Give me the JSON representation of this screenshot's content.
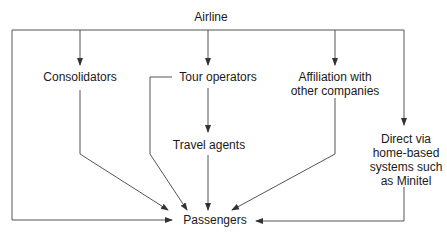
{
  "diagram": {
    "nodes": {
      "airline": {
        "label": "Airline"
      },
      "consolidators": {
        "label": "Consolidators"
      },
      "tour_operators": {
        "label": "Tour operators"
      },
      "affiliation": {
        "line1": "Affiliation with",
        "line2": "other companies"
      },
      "travel_agents": {
        "label": "Travel agents"
      },
      "direct": {
        "line1": "Direct via",
        "line2": "home-based",
        "line3": "systems such",
        "line4": "as Minitel"
      },
      "passengers": {
        "label": "Passengers"
      }
    },
    "edges": [
      {
        "from": "Airline",
        "to": "Consolidators"
      },
      {
        "from": "Airline",
        "to": "Tour operators"
      },
      {
        "from": "Airline",
        "to": "Affiliation with other companies"
      },
      {
        "from": "Airline",
        "to": "Direct via home-based systems such as Minitel"
      },
      {
        "from": "Airline",
        "to": "Passengers"
      },
      {
        "from": "Consolidators",
        "to": "Passengers"
      },
      {
        "from": "Tour operators",
        "to": "Travel agents"
      },
      {
        "from": "Tour operators",
        "to": "Passengers"
      },
      {
        "from": "Travel agents",
        "to": "Passengers"
      },
      {
        "from": "Affiliation with other companies",
        "to": "Passengers"
      },
      {
        "from": "Direct via home-based systems such as Minitel",
        "to": "Passengers"
      }
    ],
    "line_color": "#555555"
  }
}
